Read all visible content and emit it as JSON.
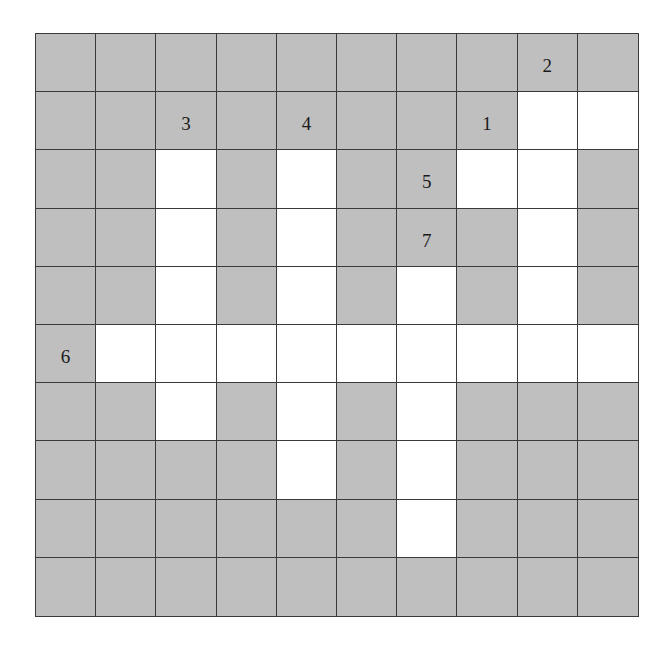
{
  "puzzle": {
    "type": "crossword-grid",
    "rows": 10,
    "cols": 10,
    "colors": {
      "blocked": "#bfbfbf",
      "open": "#ffffff",
      "line": "#3a3a3a"
    },
    "grid": [
      "GGGGGGGGGG",
      "GGGGGGGGWW",
      "GGWGWGGWWG",
      "GGWGWGGGWG",
      "GGWGWGWGWG",
      "GWWWWWWWWW",
      "GGWGWGWGGG",
      "GGGGWGWGGG",
      "GGGGGGWGGG",
      "GGGGGGGGGG"
    ],
    "clue_numbers": [
      {
        "row": 0,
        "col": 8,
        "label": "2"
      },
      {
        "row": 1,
        "col": 2,
        "label": "3"
      },
      {
        "row": 1,
        "col": 4,
        "label": "4"
      },
      {
        "row": 1,
        "col": 7,
        "label": "1"
      },
      {
        "row": 2,
        "col": 6,
        "label": "5"
      },
      {
        "row": 3,
        "col": 6,
        "label": "7"
      },
      {
        "row": 5,
        "col": 0,
        "label": "6"
      }
    ]
  }
}
